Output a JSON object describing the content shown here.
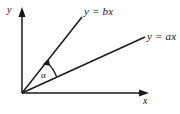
{
  "figure": {
    "kind": "geometry-diagram",
    "background_color": "#ffffff",
    "ink_color": "#1a1a1a"
  },
  "axes": {
    "x": {
      "label": "x",
      "origin": [
        22,
        93
      ],
      "end": [
        148,
        93
      ],
      "arrow": "right"
    },
    "y": {
      "label": "y",
      "origin": [
        22,
        93
      ],
      "end": [
        22,
        9
      ],
      "arrow": "up"
    }
  },
  "lines": [
    {
      "id": "line-b",
      "label": "y = bx",
      "origin": [
        22,
        93
      ],
      "end": [
        82,
        17
      ],
      "slope_symbol": "b",
      "description": "steeper ray"
    },
    {
      "id": "line-a",
      "label": "y = ax",
      "origin": [
        22,
        93
      ],
      "end": [
        145,
        37
      ],
      "slope_symbol": "a",
      "description": "shallower ray"
    }
  ],
  "angle": {
    "label": "α",
    "name": "alpha",
    "between": [
      "line-a",
      "line-b"
    ],
    "arrow": "toward line-b"
  }
}
